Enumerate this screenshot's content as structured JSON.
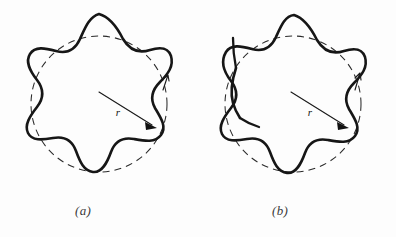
{
  "figure": {
    "background_color": "#fdfdfd",
    "curve_color": "#161616",
    "circle_color": "#2b2b2b",
    "label_color": "#141414",
    "caption_color": "#3a3a3a",
    "panels": [
      {
        "id": "a",
        "caption": "(a)",
        "radius_label": "r",
        "description": "closed star curve with six lobes and a dashed reference circle",
        "self_intersecting": "false"
      },
      {
        "id": "b",
        "caption": "(b)",
        "radius_label": "r",
        "description": "star curve with a self-intersection and two loose ends on the left side",
        "self_intersecting": "true"
      }
    ]
  },
  "artifacts": {
    "ghost_line_1": "      ",
    "ghost_line_2": "    "
  }
}
